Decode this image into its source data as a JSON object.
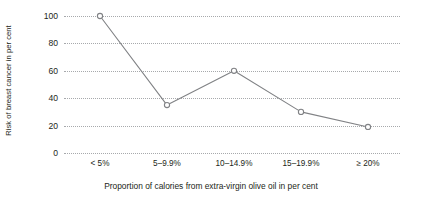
{
  "chart_data": {
    "type": "line",
    "title": "",
    "subtitle": "",
    "xlabel": "Proportion of calories from extra-virgin olive oil in per cent",
    "ylabel": "Risk of breast cancer in per cent",
    "categories": [
      "< 5%",
      "5–9.9%",
      "10–14.9%",
      "15–19.9%",
      "≥ 20%"
    ],
    "values": [
      100,
      35,
      60,
      30,
      19
    ],
    "series": [
      {
        "name": "Risk of breast cancer",
        "values": [
          100,
          35,
          60,
          30,
          19
        ]
      }
    ],
    "ylim": [
      0,
      100
    ],
    "yticks": [
      0,
      20,
      40,
      60,
      80,
      100
    ],
    "ytick_labels": [
      "0",
      "20",
      "40",
      "60",
      "80",
      "100"
    ],
    "grid": true,
    "grid_axis": "y",
    "grid_style": "dotted",
    "legend": false,
    "legend_position": "none",
    "marker": "open-circle",
    "line_color": "#808285",
    "marker_color": "#808285",
    "grid_color": "#a7a9ac",
    "text_color": "#231f20",
    "background_color": "#ffffff"
  }
}
